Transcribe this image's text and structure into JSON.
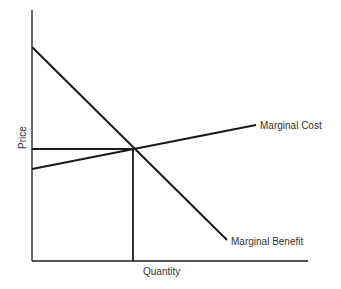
{
  "diagram": {
    "xlabel": "Quantity",
    "ylabel": "Price",
    "curves": [
      {
        "name": "Marginal Cost",
        "label": "Marginal Cost",
        "shape": "upward-sloping line"
      },
      {
        "name": "Marginal Benefit",
        "label": "Marginal Benefit",
        "shape": "downward-sloping line"
      }
    ],
    "equilibrium": {
      "description": "intersection of Marginal Cost and Marginal Benefit with dropped guide lines to both axes"
    },
    "line_color": "#1a1a1a",
    "text_color": "#333333"
  }
}
